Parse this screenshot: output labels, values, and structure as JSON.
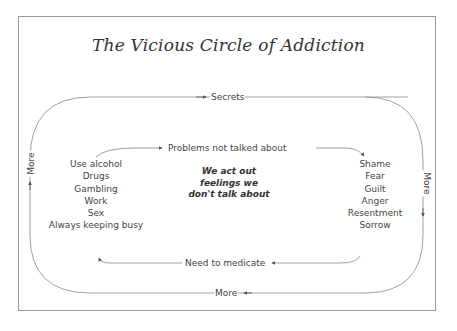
{
  "title": "The Vicious Circle of Addiction",
  "outer_loop": {
    "top_label": "Secrets",
    "right_label": "More",
    "bottom_label": "More",
    "left_label": "More"
  },
  "inner_loop": {
    "top_label": "Problems not talked about",
    "bottom_label": "Need to medicate"
  },
  "left_list": [
    "Use alcohol",
    "Drugs",
    "Gambling",
    "Work",
    "Sex",
    "Always keeping busy"
  ],
  "right_list": [
    "Shame",
    "Fear",
    "Guilt",
    "Anger",
    "Resentment",
    "Sorrow"
  ],
  "center_text": [
    "We act out",
    "feelings we",
    "don't talk about"
  ],
  "colors": {
    "line": "#8a8a8a",
    "text": "#444444",
    "frame": "#9a9a9a"
  }
}
